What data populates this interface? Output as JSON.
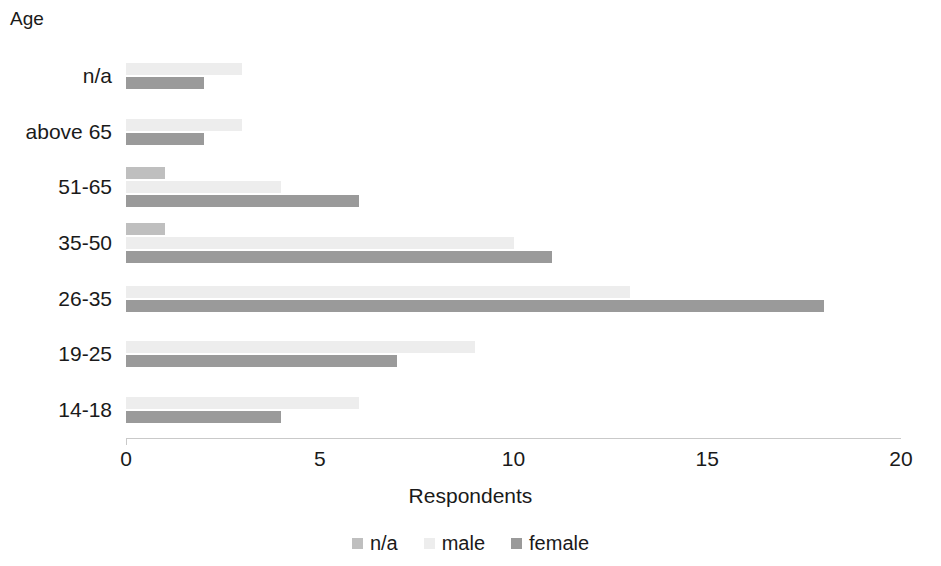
{
  "chart_data": {
    "type": "bar",
    "orientation": "horizontal",
    "title": "",
    "xlabel": "Respondents",
    "ylabel": "Age",
    "xlim": [
      0,
      20
    ],
    "xticks": [
      "0",
      "5",
      "10",
      "15",
      "20"
    ],
    "xtick_values": [
      0,
      5,
      10,
      15,
      20
    ],
    "grid": false,
    "legend_position": "bottom",
    "categories": [
      "n/a",
      "above 65",
      "51-65",
      "35-50",
      "26-35",
      "19-25",
      "14-18"
    ],
    "series": [
      {
        "name": "n/a",
        "color": "#bfbfbf",
        "values": [
          0,
          0,
          1,
          1,
          0,
          0,
          0
        ]
      },
      {
        "name": "male",
        "color": "#ededed",
        "values": [
          3,
          3,
          4,
          10,
          13,
          9,
          6
        ]
      },
      {
        "name": "female",
        "color": "#9a9a9a",
        "values": [
          2,
          2,
          6,
          11,
          18,
          7,
          4
        ]
      }
    ]
  },
  "axis": {
    "y_title": "Age",
    "x_title": "Respondents"
  },
  "legend": {
    "items": [
      {
        "label": "n/a"
      },
      {
        "label": "male"
      },
      {
        "label": "female"
      }
    ]
  }
}
